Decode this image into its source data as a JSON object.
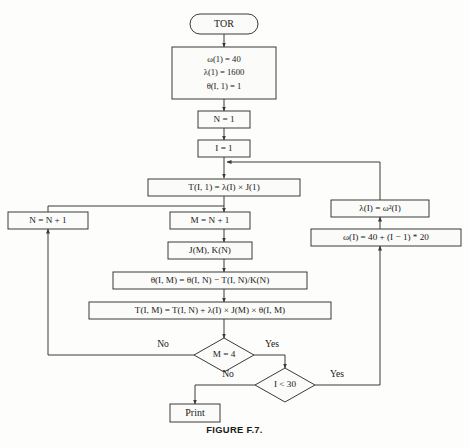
{
  "figure": {
    "caption": "FIGURE F.7."
  },
  "nodes": {
    "start": {
      "id": "start",
      "shape": "terminal",
      "label": "TOR"
    },
    "init": {
      "id": "init",
      "shape": "process",
      "lines": [
        "ω(1) = 40",
        "λ(1) = 1600",
        "θ(I, 1) = 1"
      ]
    },
    "set_n": {
      "id": "set_n",
      "shape": "process",
      "label": "N = 1"
    },
    "set_i": {
      "id": "set_i",
      "shape": "process",
      "label": "I = 1"
    },
    "t_i_1": {
      "id": "t_i_1",
      "shape": "process",
      "label": "T(I, 1) = λ(I) × J(1)"
    },
    "n_increment": {
      "id": "n_increment",
      "shape": "process",
      "label": "N = N + 1"
    },
    "m_assign": {
      "id": "m_assign",
      "shape": "process",
      "label": "M = N + 1"
    },
    "jm_kn": {
      "id": "jm_kn",
      "shape": "process",
      "label": "J(M), K(N)"
    },
    "theta_update": {
      "id": "theta_update",
      "shape": "process",
      "label": "θ(I, M) = θ(I, N) − T(I, N)/K(N)"
    },
    "t_update": {
      "id": "t_update",
      "shape": "process",
      "label": "T(I, M) = T(I, N) + λ(I) × J(M) × θ(I, M)"
    },
    "lambda_i": {
      "id": "lambda_i",
      "shape": "process",
      "label": "λ(I) = ω²(I)"
    },
    "omega_i": {
      "id": "omega_i",
      "shape": "process",
      "label": "ω(I) = 40 + (I − 1) * 20"
    },
    "decision_m": {
      "id": "decision_m",
      "shape": "decision",
      "label": "M = 4"
    },
    "decision_i": {
      "id": "decision_i",
      "shape": "decision",
      "label": "I < 30"
    },
    "print": {
      "id": "print",
      "shape": "process",
      "label": "Print"
    }
  },
  "edge_labels": {
    "m_no": "No",
    "m_yes": "Yes",
    "i_no": "No",
    "i_yes": "Yes"
  }
}
